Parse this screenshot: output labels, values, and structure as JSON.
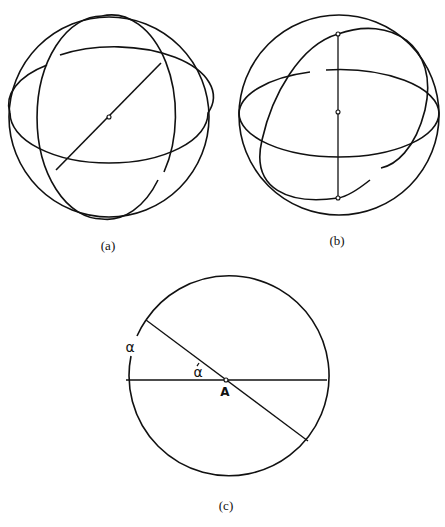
{
  "figure": {
    "panels": [
      {
        "id": "a",
        "caption": "(a)",
        "description": "Sphere with two orthogonal great circles and a diameter through the center"
      },
      {
        "id": "b",
        "caption": "(b)",
        "description": "Sphere with horizontal great circle, tilted great circle, and vertical axis with poles"
      },
      {
        "id": "c",
        "caption": "(c)",
        "description": "Circle cross-section with two diameters intersecting at point A, angle alpha"
      }
    ],
    "labels": {
      "arc_alpha": "α",
      "angle_alpha": "α",
      "center_point": "A"
    },
    "colors": {
      "line": "#111111",
      "background": "#ffffff"
    }
  }
}
